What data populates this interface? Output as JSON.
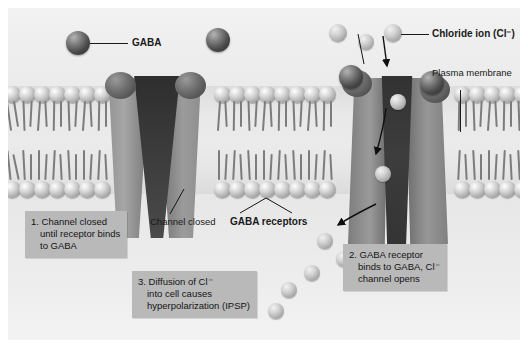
{
  "figure": {
    "labels": {
      "gaba": "GABA",
      "chloride_ion": "Chloride ion (Cl⁻)",
      "plasma_membrane_line1": "Plasma",
      "plasma_membrane_line2": "membrane",
      "channel_closed_line1": "Channel",
      "channel_closed_line2": "closed",
      "gaba_receptors_line1": "GABA",
      "gaba_receptors_line2": "receptors"
    },
    "steps": [
      {
        "id": "step-1",
        "line1": "1. Channel closed",
        "line2": "until receptor binds",
        "line3": "to GABA"
      },
      {
        "id": "step-2",
        "line1": "2. GABA receptor",
        "line2": "binds to GABA, Cl⁻",
        "line3": "channel opens"
      },
      {
        "id": "step-3",
        "line1": "3. Diffusion of Cl⁻",
        "line2": "into cell causes",
        "line3": "hyperpolarization (IPSP)"
      }
    ],
    "colors": {
      "background": "#eceded",
      "infobox": "#b9b9b9",
      "gaba_molecule": "#3a3a3a",
      "chloride_ion": "#c6c6c6",
      "channel_protein": "#8e8e8e",
      "pore": "#343434",
      "text": "#141414"
    }
  }
}
